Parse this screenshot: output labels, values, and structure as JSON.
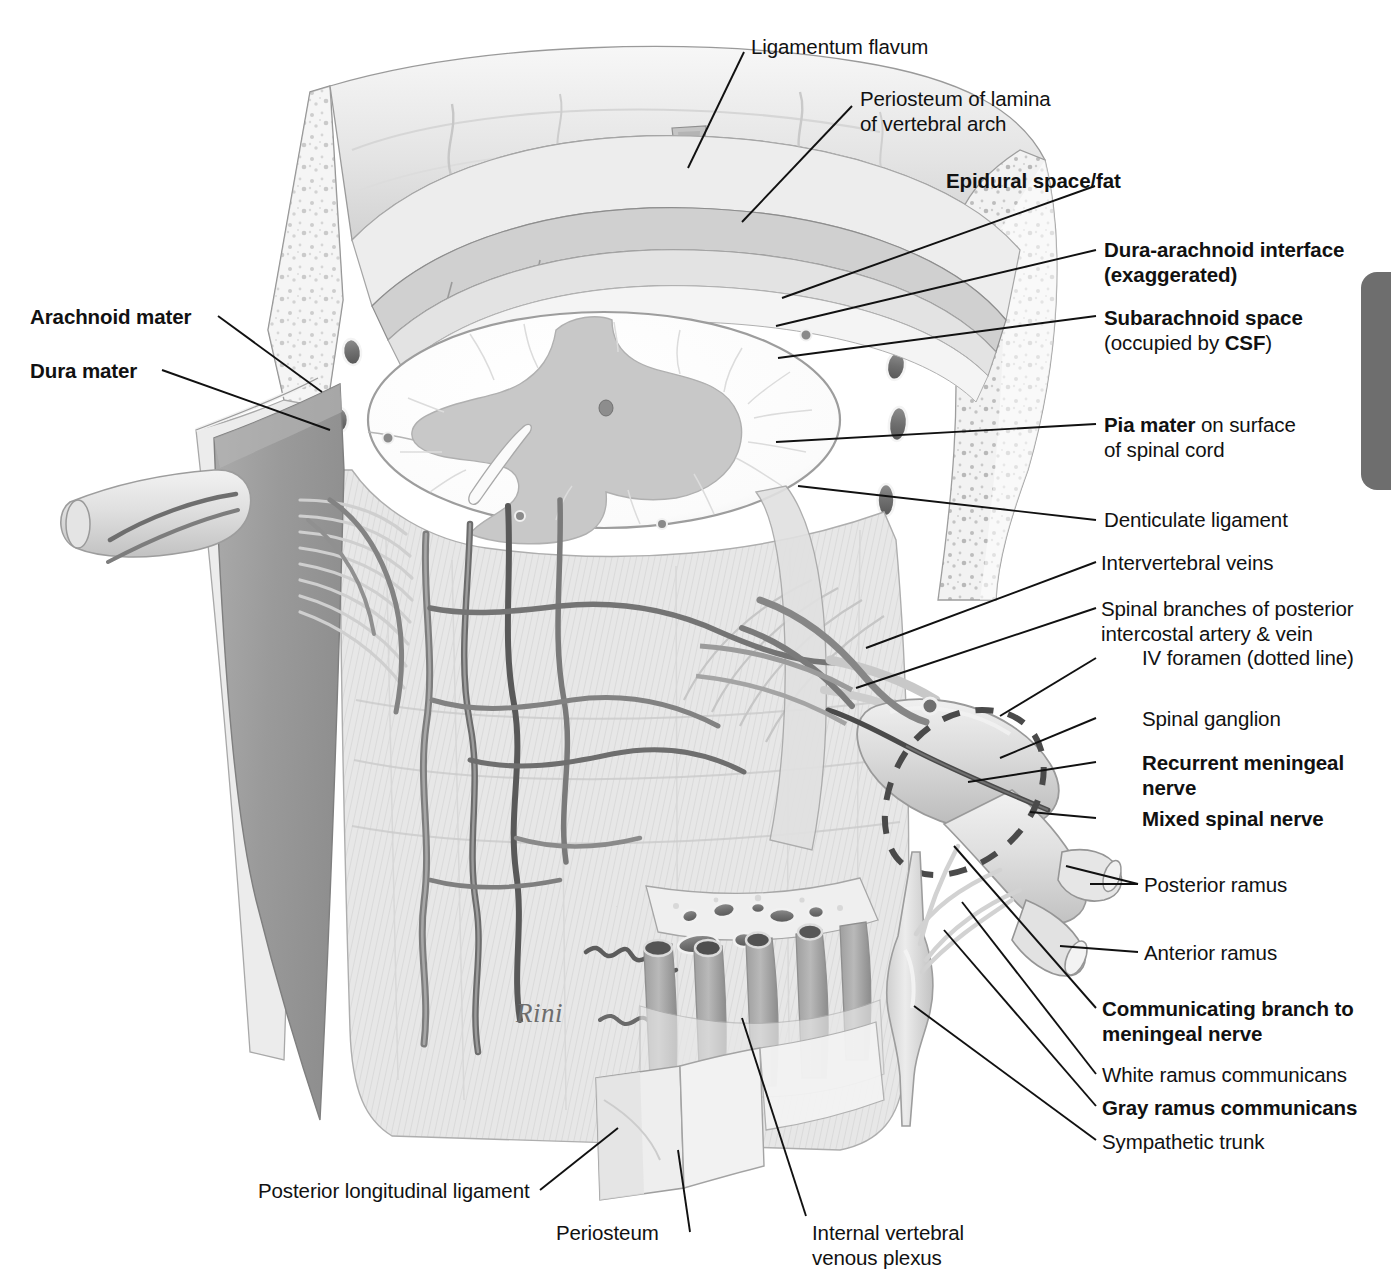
{
  "figure": {
    "signature": "Rini"
  },
  "labels": {
    "ligamentum_flavum": "Ligamentum flavum",
    "periosteum_lamina_l1": "Periosteum of lamina",
    "periosteum_lamina_l2": "of vertebral arch",
    "epidural_space_fat": "Epidural space/fat",
    "dura_arachnoid_l1": "Dura-arachnoid interface",
    "dura_arachnoid_l2": "(exaggerated)",
    "subarachnoid_space": "Subarachnoid space",
    "subarachnoid_sub_a": "(occupied by ",
    "subarachnoid_sub_csf": "CSF",
    "subarachnoid_sub_b": ")",
    "pia_mater_bold": "Pia mater",
    "pia_mater_rest": " on surface",
    "pia_mater_l2": "of spinal cord",
    "denticulate_ligament": "Denticulate ligament",
    "intervertebral_veins": "Intervertebral veins",
    "spinal_branches_l1": "Spinal branches of posterior",
    "spinal_branches_l2": "intercostal artery & vein",
    "iv_foramen": "IV foramen (dotted line)",
    "spinal_ganglion": "Spinal ganglion",
    "recurrent_meningeal_l1": "Recurrent meningeal",
    "recurrent_meningeal_l2": "nerve",
    "mixed_spinal_nerve": "Mixed spinal nerve",
    "posterior_ramus": "Posterior ramus",
    "anterior_ramus": "Anterior ramus",
    "communicating_branch_l1": "Communicating branch to",
    "communicating_branch_l2": "meningeal nerve",
    "white_ramus": "White ramus communicans",
    "gray_ramus": "Gray ramus communicans",
    "sympathetic_trunk": "Sympathetic trunk",
    "arachnoid_mater": "Arachnoid mater",
    "dura_mater": "Dura mater",
    "posterior_longitudinal_ligament": "Posterior longitudinal ligament",
    "periosteum": "Periosteum",
    "internal_venous_plexus_l1": "Internal vertebral",
    "internal_venous_plexus_l2": "venous plexus"
  },
  "colors": {
    "ink": "#111111",
    "page_tab": "#6e6e6e",
    "dura_flap": "#9a9a9a",
    "tissue_light": "#e9e9e9",
    "tissue_mid": "#d2d2d2",
    "gray_matter": "#c6c6c6",
    "white_matter": "#fdfdfd",
    "vessel_dark": "#6a6a6a",
    "vessel_mid": "#8d8d8d",
    "bone_speckle": "#b9b9b9",
    "signature": "#6d6d6d"
  }
}
